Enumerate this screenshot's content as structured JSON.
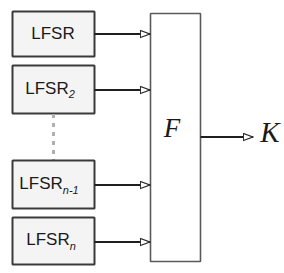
{
  "diagram": {
    "type": "block-diagram",
    "title": "",
    "background_color": "#ffffff",
    "stroke_color": "#333333",
    "box_fill": "#f4f4f4",
    "combiner_fill": "#ffffff",
    "dashed_color": "#b0b0b0",
    "text_color": "#1a1a1a",
    "registers": [
      {
        "id": "lfsr-1",
        "base": "LFSR",
        "subscript": ""
      },
      {
        "id": "lfsr-2",
        "base": "LFSR",
        "subscript": "2"
      },
      {
        "id": "lfsr-n-1",
        "base": "LFSR",
        "subscript": "n-1"
      },
      {
        "id": "lfsr-n",
        "base": "LFSR",
        "subscript": "n"
      }
    ],
    "combiner": {
      "id": "combining-function",
      "label": "F"
    },
    "output": {
      "id": "keystream",
      "label": "K"
    },
    "continuation": {
      "style": "vertical-dashed",
      "meaning": "additional registers omitted"
    }
  }
}
